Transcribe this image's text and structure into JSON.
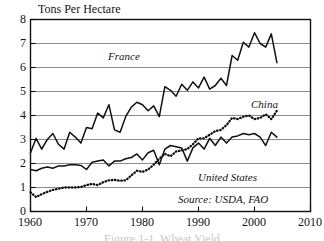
{
  "chart_data": {
    "type": "line",
    "title": "Tons Per Hectare",
    "xlabel": "",
    "ylabel": "Tons Per Hectare",
    "xlim": [
      1960,
      2010
    ],
    "ylim": [
      0,
      8
    ],
    "xticks": [
      1960,
      1970,
      1980,
      1990,
      2000,
      2010
    ],
    "yticks": [
      0,
      1,
      2,
      3,
      4,
      5,
      6,
      7,
      8
    ],
    "grid": "horizontal",
    "legend_position": "inline-annotations",
    "source": "Source: USDA, FAO",
    "series": [
      {
        "name": "France",
        "style": "solid",
        "color": "#111111",
        "label_x": 1981,
        "label_y": 6.55,
        "x": [
          1960,
          1961,
          1962,
          1963,
          1964,
          1965,
          1966,
          1967,
          1968,
          1969,
          1970,
          1971,
          1972,
          1973,
          1974,
          1975,
          1976,
          1977,
          1978,
          1979,
          1980,
          1981,
          1982,
          1983,
          1984,
          1985,
          1986,
          1987,
          1988,
          1989,
          1990,
          1991,
          1992,
          1993,
          1994,
          1995,
          1996,
          1997,
          1998,
          1999,
          2000,
          2001,
          2002,
          2003,
          2004
        ],
        "values": [
          2.45,
          3.05,
          2.6,
          3.0,
          3.25,
          2.8,
          2.6,
          3.3,
          3.1,
          2.85,
          3.5,
          3.45,
          4.1,
          3.9,
          4.45,
          3.4,
          3.3,
          3.95,
          4.35,
          4.55,
          4.45,
          4.2,
          4.4,
          3.95,
          5.2,
          5.05,
          4.8,
          5.3,
          5.05,
          5.4,
          5.15,
          5.6,
          5.1,
          5.25,
          5.55,
          5.25,
          6.5,
          6.3,
          7.05,
          6.85,
          7.45,
          7.0,
          6.85,
          7.4,
          6.2
        ]
      },
      {
        "name": "China",
        "style": "dotted",
        "color": "#111111",
        "label_x": 2000,
        "label_y": 4.45,
        "x": [
          1960,
          1961,
          1962,
          1963,
          1964,
          1965,
          1966,
          1967,
          1968,
          1969,
          1970,
          1971,
          1972,
          1973,
          1974,
          1975,
          1976,
          1977,
          1978,
          1979,
          1980,
          1981,
          1982,
          1983,
          1984,
          1985,
          1986,
          1987,
          1988,
          1989,
          1990,
          1991,
          1992,
          1993,
          1994,
          1995,
          1996,
          1997,
          1998,
          1999,
          2000,
          2001,
          2002,
          2003,
          2004
        ],
        "values": [
          0.8,
          0.6,
          0.72,
          0.82,
          0.9,
          0.95,
          1.0,
          1.0,
          1.0,
          1.02,
          1.1,
          1.15,
          1.1,
          1.22,
          1.3,
          1.32,
          1.28,
          1.3,
          1.5,
          1.7,
          1.65,
          1.75,
          1.95,
          2.2,
          2.4,
          2.3,
          2.5,
          2.55,
          2.6,
          2.8,
          3.05,
          3.05,
          3.2,
          3.35,
          3.4,
          3.6,
          3.9,
          3.85,
          3.95,
          4.0,
          3.85,
          3.9,
          4.05,
          3.85,
          4.2
        ]
      },
      {
        "name": "United States",
        "style": "solid",
        "color": "#111111",
        "label_x": 1996,
        "label_y": 1.55,
        "x": [
          1960,
          1961,
          1962,
          1963,
          1964,
          1965,
          1966,
          1967,
          1968,
          1969,
          1970,
          1971,
          1972,
          1973,
          1974,
          1975,
          1976,
          1977,
          1978,
          1979,
          1980,
          1981,
          1982,
          1983,
          1984,
          1985,
          1986,
          1987,
          1988,
          1989,
          1990,
          1991,
          1992,
          1993,
          1994,
          1995,
          1996,
          1997,
          1998,
          1999,
          2000,
          2001,
          2002,
          2003,
          2004
        ],
        "values": [
          1.75,
          1.7,
          1.8,
          1.85,
          1.8,
          1.9,
          1.9,
          1.95,
          1.95,
          1.92,
          1.75,
          2.05,
          2.1,
          2.15,
          1.9,
          2.1,
          2.1,
          2.2,
          2.25,
          2.4,
          2.15,
          2.45,
          2.55,
          1.95,
          2.6,
          2.75,
          2.7,
          2.65,
          2.1,
          2.65,
          2.85,
          2.6,
          3.05,
          2.75,
          3.1,
          2.85,
          3.1,
          3.15,
          3.25,
          3.2,
          3.25,
          3.1,
          2.75,
          3.3,
          3.1
        ]
      }
    ]
  },
  "axis": {
    "title": "Tons Per Hectare",
    "y_labels": [
      "0",
      "1",
      "2",
      "3",
      "4",
      "5",
      "6",
      "7",
      "8"
    ],
    "x_labels": [
      "1960",
      "1970",
      "1980",
      "1990",
      "2000",
      "2010"
    ]
  },
  "annotations": {
    "france": "France",
    "china": "China",
    "united_states": "United States",
    "source": "Source: USDA, FAO"
  },
  "caption": {
    "partial_text": "Figure 1-1. Wheat Yield"
  }
}
